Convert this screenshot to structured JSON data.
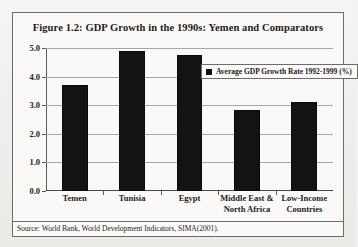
{
  "figure": {
    "title": "Figure 1.2: GDP Growth in the 1990s: Yemen and Comparators",
    "source": "Source: World Bank, World Development Indicators, SIMA(2001)."
  },
  "chart_data": {
    "type": "bar",
    "title": "Figure 1.2: GDP Growth in the 1990s: Yemen and Comparators",
    "categories": [
      "Temen",
      "Tunisia",
      "Egypt",
      "Middle East & North Africa",
      "Low-Income Countries"
    ],
    "values": [
      3.7,
      4.9,
      4.75,
      2.85,
      3.1
    ],
    "series": [
      {
        "name": "Average GDP Growth Rate 1992-1999 (%)",
        "values": [
          3.7,
          4.9,
          4.75,
          2.85,
          3.1
        ],
        "color": "#141312"
      }
    ],
    "xlabel": "",
    "ylabel": "",
    "ylim": [
      0.0,
      5.0
    ],
    "ytick_labels": [
      "0.0",
      "1.0",
      "2.0",
      "3.0",
      "4.0",
      "5.0"
    ],
    "ytick_values": [
      0.0,
      1.0,
      2.0,
      3.0,
      4.0,
      5.0
    ],
    "grid": true,
    "legend": {
      "position": "top-right",
      "entries": [
        "Average GDP Growth Rate 1992-1999 (%)"
      ]
    }
  }
}
